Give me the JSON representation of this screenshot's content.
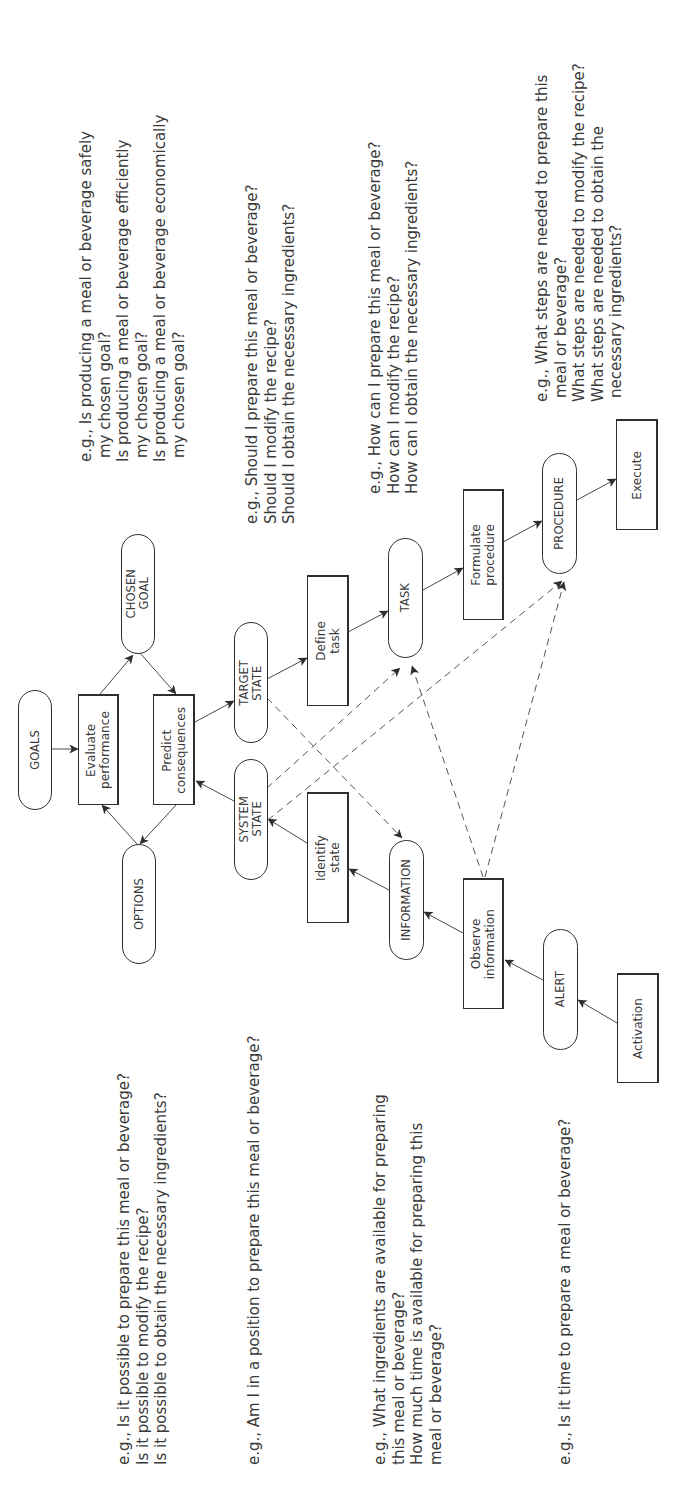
{
  "diagram": {
    "orientation": "rotated -90deg (text reads bottom to top)",
    "nodes": {
      "goals": {
        "label": "GOALS",
        "type": "state"
      },
      "evaluate": {
        "label": "Evaluate\nperformance",
        "type": "process"
      },
      "chosen_goal": {
        "label": "CHOSEN\nGOAL",
        "type": "state"
      },
      "options": {
        "label": "OPTIONS",
        "type": "state"
      },
      "predict": {
        "label": "Predict\nconsequences",
        "type": "process"
      },
      "target_state": {
        "label": "TARGET\nSTATE",
        "type": "state"
      },
      "system_state": {
        "label": "SYSTEM\nSTATE",
        "type": "state"
      },
      "define_task": {
        "label": "Define\ntask",
        "type": "process"
      },
      "identify_state": {
        "label": "Identify\nstate",
        "type": "process"
      },
      "task": {
        "label": "TASK",
        "type": "state"
      },
      "information": {
        "label": "INFORMATION",
        "type": "state"
      },
      "formulate": {
        "label": "Formulate\nprocedure",
        "type": "process"
      },
      "observe": {
        "label": "Observe\ninformation",
        "type": "process"
      },
      "procedure": {
        "label": "PROCEDURE",
        "type": "state"
      },
      "alert": {
        "label": "ALERT",
        "type": "state"
      },
      "execute": {
        "label": "Execute",
        "type": "process"
      },
      "activation": {
        "label": "Activation",
        "type": "process"
      }
    },
    "edges": [
      {
        "from": "goals",
        "to": "evaluate",
        "style": "solid"
      },
      {
        "from": "evaluate",
        "to": "chosen_goal",
        "style": "solid"
      },
      {
        "from": "chosen_goal",
        "to": "predict",
        "style": "solid"
      },
      {
        "from": "predict",
        "to": "options",
        "style": "solid"
      },
      {
        "from": "options",
        "to": "evaluate",
        "style": "solid"
      },
      {
        "from": "predict",
        "to": "target_state",
        "style": "solid"
      },
      {
        "from": "system_state",
        "to": "predict",
        "style": "solid"
      },
      {
        "from": "target_state",
        "to": "define_task",
        "style": "solid"
      },
      {
        "from": "define_task",
        "to": "task",
        "style": "solid"
      },
      {
        "from": "task",
        "to": "formulate",
        "style": "solid"
      },
      {
        "from": "formulate",
        "to": "procedure",
        "style": "solid"
      },
      {
        "from": "procedure",
        "to": "execute",
        "style": "solid"
      },
      {
        "from": "activation",
        "to": "alert",
        "style": "solid"
      },
      {
        "from": "alert",
        "to": "observe",
        "style": "solid"
      },
      {
        "from": "observe",
        "to": "information",
        "style": "solid"
      },
      {
        "from": "information",
        "to": "identify_state",
        "style": "solid"
      },
      {
        "from": "identify_state",
        "to": "system_state",
        "style": "solid"
      },
      {
        "from": "system_state",
        "to": "task",
        "style": "dashed"
      },
      {
        "from": "system_state",
        "to": "procedure",
        "style": "dashed"
      },
      {
        "from": "target_state",
        "to": "information",
        "style": "dashed"
      },
      {
        "from": "observe",
        "to": "task",
        "style": "dashed"
      },
      {
        "from": "observe",
        "to": "procedure",
        "style": "dashed"
      }
    ],
    "questions": {
      "chosen_goal": [
        "e.g., Is producing a meal or beverage safely",
        "my chosen goal?",
        "Is producing a meal or beverage efficiently",
        "my chosen goal?",
        "Is producing a meal or beverage economically",
        "my chosen goal?"
      ],
      "target_state": [
        "e.g., Should I prepare this meal or beverage?",
        "Should I modify the recipe?",
        "Should I obtain the necessary ingredients?"
      ],
      "task": [
        "e.g., How can I prepare this meal or beverage?",
        "How can I modify the recipe?",
        "How can I obtain the necessary ingredients?"
      ],
      "procedure": [
        "e.g., What steps are needed to prepare this",
        "meal or beverage?",
        "What steps are needed to modify the recipe?",
        "What steps are needed to obtain the",
        "necessary  ingredients?"
      ],
      "options": [
        "e.g., Is it possible to prepare this meal or beverage?",
        "Is it possible to modify the recipe?",
        "Is it possible to obtain the necessary ingredients?"
      ],
      "system_state": [
        "e.g., Am I in a position to prepare this meal or beverage?"
      ],
      "information": [
        "e.g., What ingredients are available for preparing",
        "this meal or beverage?",
        "How much time is available for preparing this",
        "meal or beverage?"
      ],
      "alert": [
        "e.g., Is it time to prepare a meal or beverage?"
      ]
    },
    "colors": {
      "line": "#2e2e2e",
      "text": "#3a3a3a",
      "background": "#ffffff"
    }
  }
}
